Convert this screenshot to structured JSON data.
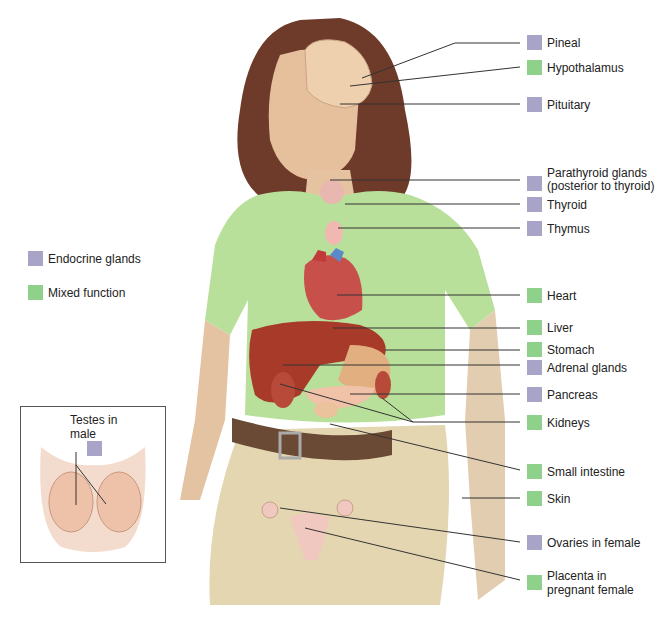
{
  "legend": {
    "items": [
      {
        "key": "endocrine",
        "label": "Endocrine glands",
        "color": "#a7a4c8"
      },
      {
        "key": "mixed",
        "label": "Mixed function",
        "color": "#8fd08a"
      }
    ]
  },
  "labels": [
    {
      "text": "Pineal",
      "type": "endocrine"
    },
    {
      "text": "Hypothalamus",
      "type": "mixed"
    },
    {
      "text": "Pituitary",
      "type": "endocrine"
    },
    {
      "text": "Parathyroid glands",
      "text2": "(posterior to thyroid)",
      "type": "endocrine"
    },
    {
      "text": "Thyroid",
      "type": "endocrine"
    },
    {
      "text": "Thymus",
      "type": "endocrine"
    },
    {
      "text": "Heart",
      "type": "mixed"
    },
    {
      "text": "Liver",
      "type": "mixed"
    },
    {
      "text": "Stomach",
      "type": "mixed"
    },
    {
      "text": "Adrenal glands",
      "type": "endocrine"
    },
    {
      "text": "Pancreas",
      "type": "endocrine"
    },
    {
      "text": "Kidneys",
      "type": "mixed"
    },
    {
      "text": "Small intestine",
      "type": "mixed"
    },
    {
      "text": "Skin",
      "type": "mixed"
    },
    {
      "text": "Ovaries in female",
      "type": "endocrine"
    },
    {
      "text": "Placenta in",
      "text2": "pregnant female",
      "type": "mixed"
    }
  ],
  "inset": {
    "title_line1": "Testes in",
    "title_line2": "male",
    "type": "endocrine"
  },
  "colors": {
    "endocrine": "#a7a4c8",
    "mixed": "#8fd08a",
    "shirt": "#b9e09a",
    "skin": "#e9c8a8",
    "hair": "#6e3b2a",
    "pants": "#e3d6b0",
    "belt": "#6a4a35",
    "organ_red": "#a83a2a"
  }
}
